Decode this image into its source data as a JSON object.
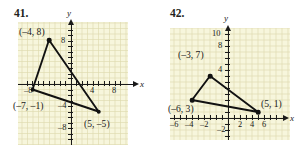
{
  "page": {
    "background": "#ffffff",
    "grid_fill": "#f7f6dc",
    "grid_line_color": "#d6d3a0",
    "ink_color": "#1a1a1a"
  },
  "problems": [
    {
      "number": "41.",
      "axis_labels": {
        "x": "x",
        "y": "y"
      },
      "x_tick_labels": [
        {
          "value": -8,
          "text": "–8"
        },
        {
          "value": 4,
          "text": "4"
        },
        {
          "value": 8,
          "text": "8"
        }
      ],
      "y_tick_labels": [
        {
          "value": 8,
          "text": "8"
        },
        {
          "value": -4,
          "text": "–4"
        },
        {
          "value": -8,
          "text": "–8"
        }
      ],
      "x_range": [
        -10,
        10
      ],
      "y_range": [
        -11,
        11
      ],
      "vertices": [
        {
          "x": -4,
          "y": 8,
          "label": "(–4, 8)",
          "label_pos": "above-left"
        },
        {
          "x": -7,
          "y": -1,
          "label": "(–7, –1)",
          "label_pos": "below-left"
        },
        {
          "x": 5,
          "y": -5,
          "label": "(5, –5)",
          "label_pos": "below-right"
        }
      ]
    },
    {
      "number": "42.",
      "axis_labels": {
        "x": "x",
        "y": "y"
      },
      "x_tick_labels": [
        {
          "value": -6,
          "text": "–6"
        },
        {
          "value": -4,
          "text": "–4"
        },
        {
          "value": -2,
          "text": "–2"
        },
        {
          "value": 2,
          "text": "2"
        },
        {
          "value": 4,
          "text": "4"
        },
        {
          "value": 6,
          "text": "6"
        }
      ],
      "y_tick_labels": [
        {
          "value": 10,
          "text": "10"
        },
        {
          "value": 8,
          "text": "8"
        },
        {
          "value": 4,
          "text": "4"
        },
        {
          "value": -2,
          "text": "–2"
        }
      ],
      "x_range": [
        -8,
        8
      ],
      "y_range": [
        -4,
        11
      ],
      "vertices": [
        {
          "x": -3,
          "y": 7,
          "label": "(–3, 7)",
          "label_pos": "above-left"
        },
        {
          "x": -6,
          "y": 3,
          "label": "(–6, 3)",
          "label_pos": "below-left"
        },
        {
          "x": 5,
          "y": 1,
          "label": "(5, 1)",
          "label_pos": "above-right"
        }
      ]
    }
  ]
}
